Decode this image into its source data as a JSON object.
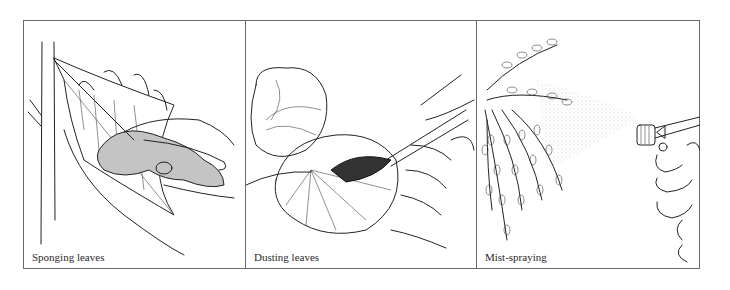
{
  "figure": {
    "panels": [
      {
        "id": "sponging",
        "caption": "Sponging leaves",
        "sponge_color": "#c4c4c4"
      },
      {
        "id": "dusting",
        "caption": "Dusting leaves"
      },
      {
        "id": "mist",
        "caption": "Mist-spraying"
      }
    ],
    "border_color": "#6a6a6a",
    "ink_color": "#222222"
  }
}
